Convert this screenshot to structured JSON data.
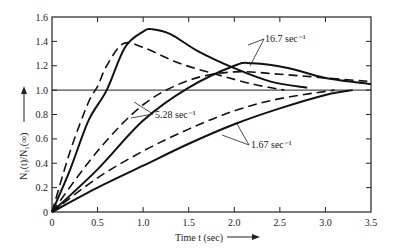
{
  "chart_data": {
    "type": "line",
    "title": "",
    "xlabel": "Time t (sec)",
    "ylabel": "N1(t)/N1(∞)",
    "xlim": [
      0,
      3.5
    ],
    "ylim": [
      0,
      1.6
    ],
    "x_ticks": [
      "0",
      "0.5",
      "1.0",
      "1.5",
      "2.0",
      "2.5",
      "3.0",
      "3.5"
    ],
    "y_ticks": [
      "0",
      "0.2",
      "0.4",
      "0.6",
      "0.8",
      "1.0",
      "1.2",
      "1.4",
      "1.6"
    ],
    "reference_line": 1.0,
    "grid": false,
    "series": [
      {
        "name": "16.7 sec^-1 (solid)",
        "style": "solid",
        "x": [
          0,
          0.2,
          0.4,
          0.6,
          0.8,
          1.0,
          1.1,
          1.3,
          1.6,
          2.0,
          2.4,
          2.8
        ],
        "y": [
          0,
          0.35,
          0.75,
          1.0,
          1.35,
          1.48,
          1.5,
          1.46,
          1.32,
          1.18,
          1.07,
          1.02
        ]
      },
      {
        "name": "16.7 sec^-1 (dashed)",
        "style": "dashed",
        "x": [
          0,
          0.2,
          0.4,
          0.5,
          0.6,
          0.78,
          1.0,
          1.4,
          1.8,
          2.2,
          2.55
        ],
        "y": [
          0,
          0.5,
          0.9,
          1.03,
          1.2,
          1.38,
          1.35,
          1.22,
          1.13,
          1.05,
          1.0
        ]
      },
      {
        "name": "5.28 sec^-1 (solid)",
        "style": "solid",
        "x": [
          0,
          0.5,
          1.0,
          1.5,
          2.0,
          2.2,
          2.6,
          3.0,
          3.5
        ],
        "y": [
          0,
          0.35,
          0.75,
          1.02,
          1.2,
          1.22,
          1.18,
          1.1,
          1.05
        ]
      },
      {
        "name": "5.28 sec^-1 (dashed)",
        "style": "dashed",
        "x": [
          0,
          0.5,
          1.0,
          1.5,
          2.0,
          2.5,
          3.0,
          3.5
        ],
        "y": [
          0,
          0.5,
          0.88,
          1.08,
          1.15,
          1.13,
          1.1,
          1.07
        ]
      },
      {
        "name": "1.67 sec^-1 (solid)",
        "style": "solid",
        "x": [
          0,
          0.5,
          1.0,
          1.5,
          2.0,
          2.5,
          3.0,
          3.3
        ],
        "y": [
          0,
          0.2,
          0.38,
          0.56,
          0.72,
          0.85,
          0.96,
          1.0
        ]
      },
      {
        "name": "1.67 sec^-1 (dashed)",
        "style": "dashed",
        "x": [
          0,
          0.5,
          1.0,
          1.5,
          2.0,
          2.5,
          3.1
        ],
        "y": [
          0,
          0.28,
          0.5,
          0.68,
          0.83,
          0.93,
          1.0
        ]
      }
    ],
    "annotations": [
      "16.7 sec^-1",
      "5.28 sec^-1",
      "1.67 sec^-1"
    ]
  },
  "labels": {
    "xlabel": "Time t (sec)",
    "ylabel": "N₁(t)/N₁(∞)",
    "ann_16": "16.7 sec⁻¹",
    "ann_528": "5.28 sec⁻¹",
    "ann_167": "1.67 sec⁻¹"
  }
}
